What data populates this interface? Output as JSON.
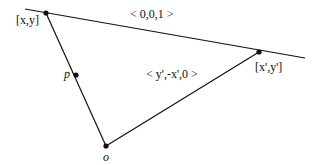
{
  "diagram": {
    "labels": {
      "point_xy": "[x,y]",
      "point_xy_prime": "[x',y']",
      "vector_top": "< 0,0,1 >",
      "vector_diag": "< y',-x',0 >",
      "point_p": "p",
      "point_o": "o"
    },
    "points": {
      "xy": [
        46,
        13
      ],
      "xy_prime": [
        259,
        52
      ],
      "p": [
        76,
        75
      ],
      "o": [
        106,
        146
      ]
    },
    "line": {
      "start": [
        25,
        9
      ],
      "end": [
        305,
        58
      ]
    },
    "colors": {
      "stroke": "#111111",
      "background": "#ffffff"
    }
  }
}
